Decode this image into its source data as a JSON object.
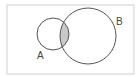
{
  "diagram": {
    "type": "venn",
    "sets": [
      {
        "id": "A",
        "label": "A",
        "cx": 53,
        "cy": 34,
        "r": 16,
        "label_x": 37,
        "label_y": 59
      },
      {
        "id": "B",
        "label": "B",
        "cx": 88,
        "cy": 36,
        "r": 28,
        "label_x": 116,
        "label_y": 25
      }
    ],
    "shaded_region": "A ∩ B",
    "colors": {
      "stroke": "#555555",
      "shade": "#c8c8c8",
      "frame": "#d0d0d0",
      "background": "#ffffff"
    }
  }
}
